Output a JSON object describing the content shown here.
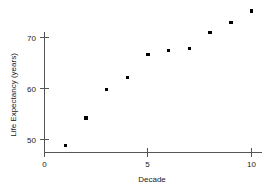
{
  "chart_data": {
    "type": "scatter",
    "title": "",
    "xlabel": "Decade",
    "ylabel": "Life Expectancy (years)",
    "x": [
      1,
      2,
      3,
      4,
      5,
      6,
      7,
      8,
      9,
      10
    ],
    "values": [
      48.8,
      54.2,
      59.8,
      62.2,
      66.7,
      67.5,
      67.8,
      71.0,
      73.0,
      75.2
    ],
    "xticks": [
      0,
      5,
      10
    ],
    "xtick_labels": [
      "0",
      "5",
      "10"
    ],
    "yticks": [
      50,
      60,
      70
    ],
    "ytick_labels": [
      "50",
      "60",
      "70"
    ],
    "xlim": [
      0,
      10.6
    ],
    "ylim": [
      47.6,
      76.4
    ],
    "grid": false,
    "legend": null,
    "marker": "square",
    "marker_color": "#000000",
    "axis_color": "#555555",
    "background_color": "#ffffff"
  },
  "axes": {
    "x_title": "Decade",
    "y_title": "Life Expectancy (years)"
  }
}
